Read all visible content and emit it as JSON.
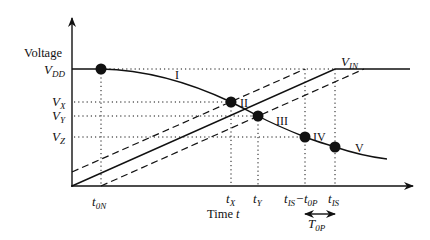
{
  "figure": {
    "y_axis_label": "Voltage",
    "x_axis_label": "Time t",
    "x_axis_label_main": "Time ",
    "x_axis_label_var": "t",
    "voltage_levels": [
      {
        "id": "vdd",
        "main": "V",
        "sub": "DD"
      },
      {
        "id": "vx",
        "main": "V",
        "sub": "X"
      },
      {
        "id": "vy",
        "main": "V",
        "sub": "Y"
      },
      {
        "id": "vz",
        "main": "V",
        "sub": "Z"
      }
    ],
    "input_curve_label": {
      "main": "V",
      "sub": "IN"
    },
    "time_ticks": [
      {
        "id": "t0n",
        "main": "t",
        "sub": "0N"
      },
      {
        "id": "tx",
        "main": "t",
        "sub": "X"
      },
      {
        "id": "ty",
        "main": "t",
        "sub": "Y"
      },
      {
        "id": "tis-minus-t0p",
        "main": "t",
        "sub": "IS",
        "mid": "−t",
        "sub2": "0P"
      },
      {
        "id": "tis",
        "main": "t",
        "sub": "IS"
      }
    ],
    "interval_label": {
      "main": "T",
      "sub": "0P"
    },
    "region_labels": [
      "I",
      "II",
      "III",
      "IV",
      "V"
    ],
    "colors": {
      "line": "#111111",
      "background": "#ffffff"
    }
  }
}
